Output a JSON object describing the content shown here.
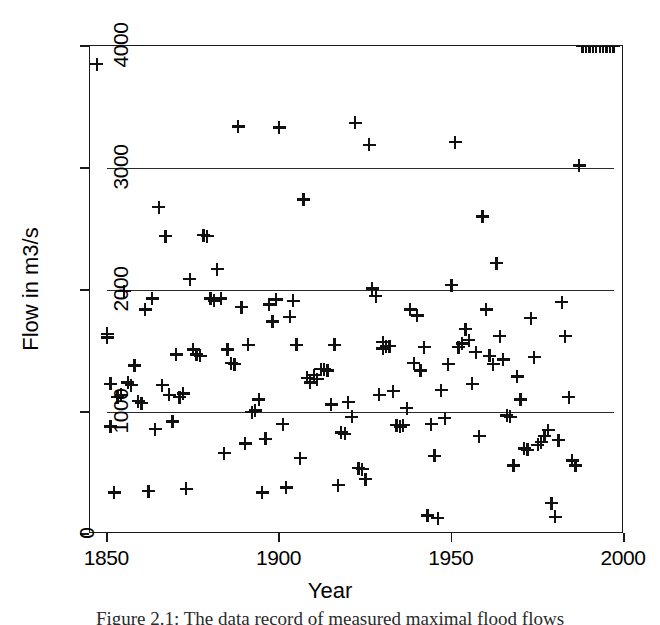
{
  "figure": {
    "caption": "Figure 2.1:  The data record of measured maximal flood flows"
  },
  "chart_data": {
    "type": "scatter",
    "title": "",
    "xlabel": "Year",
    "ylabel": "Flow in m3/s",
    "xlim": [
      1845,
      2000
    ],
    "ylim": [
      0,
      4000
    ],
    "xticks": [
      1850,
      1900,
      1950,
      2000
    ],
    "yticks": [
      0,
      1000,
      2000,
      3000,
      4000
    ],
    "xtick_labels": [
      "1850",
      "1900",
      "1950",
      "2000"
    ],
    "ytick_labels": [
      "0",
      "1000",
      "2000",
      "3000",
      "4000"
    ],
    "grid": false,
    "legend": null,
    "marker": "plus",
    "marker_color": "#111111",
    "reference_lines": [
      {
        "y": 1000,
        "x_start": 1850,
        "x_end": 1997,
        "color": "#2b2b2b"
      },
      {
        "y": 2000,
        "x_start": 1850,
        "x_end": 1997,
        "color": "#2b2b2b"
      },
      {
        "y": 3000,
        "x_start": 1850,
        "x_end": 1997,
        "color": "#2b2b2b"
      }
    ],
    "x": [
      1847,
      1850,
      1850,
      1851,
      1851,
      1852,
      1853,
      1854,
      1855,
      1856,
      1857,
      1858,
      1859,
      1860,
      1861,
      1862,
      1863,
      1864,
      1865,
      1866,
      1867,
      1868,
      1869,
      1870,
      1871,
      1872,
      1873,
      1874,
      1875,
      1876,
      1877,
      1878,
      1879,
      1880,
      1881,
      1882,
      1883,
      1884,
      1885,
      1886,
      1887,
      1888,
      1889,
      1890,
      1891,
      1892,
      1893,
      1894,
      1895,
      1896,
      1897,
      1898,
      1899,
      1900,
      1901,
      1902,
      1903,
      1904,
      1905,
      1906,
      1907,
      1908,
      1909,
      1910,
      1911,
      1912,
      1913,
      1914,
      1915,
      1916,
      1917,
      1918,
      1919,
      1920,
      1921,
      1922,
      1923,
      1924,
      1925,
      1926,
      1927,
      1928,
      1929,
      1930,
      1930,
      1931,
      1932,
      1933,
      1934,
      1935,
      1936,
      1937,
      1938,
      1939,
      1940,
      1941,
      1942,
      1943,
      1944,
      1945,
      1946,
      1947,
      1948,
      1949,
      1950,
      1951,
      1952,
      1953,
      1954,
      1955,
      1956,
      1957,
      1958,
      1959,
      1960,
      1961,
      1962,
      1963,
      1964,
      1965,
      1966,
      1967,
      1968,
      1969,
      1970,
      1971,
      1972,
      1973,
      1974,
      1975,
      1976,
      1977,
      1978,
      1979,
      1980,
      1981,
      1982,
      1983,
      1984,
      1985,
      1986,
      1987,
      1988,
      1989,
      1990,
      1991,
      1992,
      1993,
      1994,
      1995,
      1996,
      1997
    ],
    "y": [
      3850,
      1640,
      1610,
      1230,
      880,
      340,
      1120,
      1140,
      1990,
      1240,
      1220,
      1380,
      1090,
      1070,
      1840,
      350,
      1930,
      860,
      2680,
      1220,
      2440,
      1140,
      920,
      1470,
      1120,
      1150,
      370,
      2090,
      1510,
      1470,
      1460,
      2450,
      2440,
      1930,
      1910,
      2170,
      1930,
      660,
      1510,
      1400,
      1390,
      3340,
      1860,
      740,
      1550,
      1000,
      1010,
      1100,
      340,
      780,
      1880,
      1740,
      1920,
      3330,
      900,
      380,
      1780,
      1910,
      1550,
      620,
      2740,
      1280,
      1240,
      1300,
      1270,
      1350,
      1350,
      1340,
      1060,
      1550,
      400,
      830,
      820,
      1080,
      960,
      3370,
      540,
      530,
      450,
      3190,
      2010,
      1950,
      1140,
      1570,
      1520,
      1540,
      1540,
      1170,
      890,
      880,
      890,
      1030,
      1840,
      1400,
      1790,
      1340,
      1530,
      150,
      900,
      640,
      130,
      1180,
      950,
      1390,
      2040,
      3210,
      1530,
      1560,
      1680,
      1590,
      1230,
      1490,
      800,
      2600,
      1840,
      1460,
      1390,
      2220,
      1620,
      1430,
      970,
      960,
      560,
      1290,
      1100,
      700,
      690,
      1770,
      1450,
      730,
      750,
      800,
      850,
      250,
      140,
      770,
      1900,
      1620,
      1120,
      600,
      560,
      3020
    ],
    "n_points": 152
  }
}
